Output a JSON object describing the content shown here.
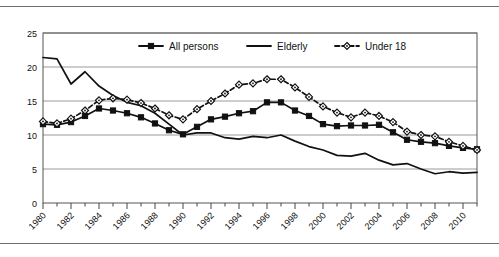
{
  "chart_data": {
    "type": "line",
    "title": "",
    "xlabel": "",
    "ylabel": "",
    "ylim": [
      0,
      25
    ],
    "ytick_step": 5,
    "yticks": [
      "0",
      "5",
      "10",
      "15",
      "20",
      "25"
    ],
    "grid": true,
    "grid_axis": "y",
    "legend_position": "top-center",
    "x": [
      1980,
      1981,
      1982,
      1983,
      1984,
      1985,
      1986,
      1987,
      1988,
      1989,
      1990,
      1991,
      1992,
      1993,
      1994,
      1995,
      1996,
      1997,
      1998,
      1999,
      2000,
      2001,
      2002,
      2003,
      2004,
      2005,
      2006,
      2007,
      2008,
      2009,
      2010,
      2011
    ],
    "xticks": [
      "1980",
      "1982",
      "1984",
      "1986",
      "1988",
      "1990",
      "1992",
      "1994",
      "1996",
      "1998",
      "2000",
      "2002",
      "2004",
      "2006",
      "2008",
      "2010"
    ],
    "xtick_step": 2,
    "series": [
      {
        "name": "All persons",
        "marker": "filled-square",
        "line": "solid",
        "color": "#111111",
        "values": [
          11.6,
          11.5,
          11.9,
          12.8,
          13.9,
          13.6,
          13.2,
          12.6,
          11.7,
          10.7,
          10.1,
          11.2,
          12.3,
          12.7,
          13.2,
          13.5,
          14.8,
          14.8,
          13.6,
          12.8,
          11.6,
          11.3,
          11.4,
          11.4,
          11.5,
          10.4,
          9.3,
          9.0,
          8.8,
          8.4,
          8.1,
          7.9
        ]
      },
      {
        "name": "Elderly",
        "marker": "none",
        "line": "solid",
        "color": "#111111",
        "values": [
          21.4,
          21.2,
          17.5,
          19.3,
          17.2,
          15.8,
          14.8,
          14.3,
          13.2,
          11.6,
          10.0,
          10.3,
          10.3,
          9.6,
          9.4,
          9.8,
          9.6,
          10.0,
          9.1,
          8.3,
          7.8,
          7.0,
          6.9,
          7.3,
          6.3,
          5.6,
          5.8,
          5.0,
          4.3,
          4.6,
          4.4,
          4.5
        ]
      },
      {
        "name": "Under 18",
        "marker": "open-diamond",
        "line": "dashed",
        "color": "#111111",
        "values": [
          12.0,
          11.7,
          12.4,
          13.6,
          15.1,
          15.4,
          15.2,
          14.7,
          13.9,
          12.9,
          12.3,
          13.8,
          15.0,
          16.1,
          17.4,
          17.6,
          18.2,
          18.2,
          17.0,
          15.6,
          14.2,
          13.3,
          12.6,
          13.3,
          12.8,
          11.9,
          10.5,
          10.0,
          9.8,
          9.0,
          8.4,
          7.8
        ]
      }
    ]
  },
  "legend": {
    "items": [
      {
        "label": "All persons"
      },
      {
        "label": "Elderly"
      },
      {
        "label": "Under 18"
      }
    ]
  }
}
